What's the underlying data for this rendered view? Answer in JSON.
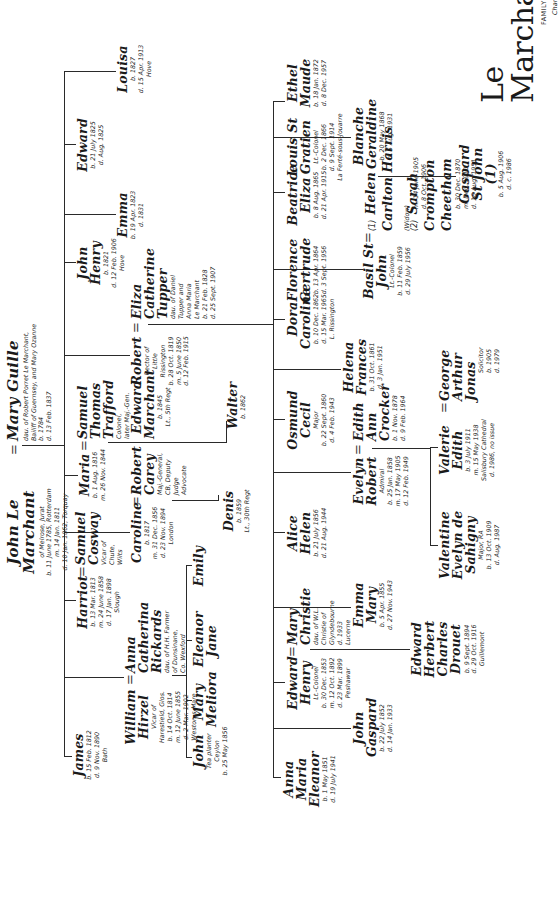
{
  "chart_title": {
    "title": "Le Marchant",
    "subtitle": "FAMILY TREE",
    "chart_no": "Chart I"
  },
  "root": {
    "husband": {
      "name": "John Le Marchant",
      "details": [
        "of Melrose, Jurat",
        "b. 11 June 1785, Rotterdam",
        "m. 14 Jan. 1811",
        "d. 10 Jan. 1862, Torquay"
      ]
    },
    "wife": {
      "name": "Mary Guille",
      "details": [
        "dau. of Robert Porret Le Marchant,",
        "Bailiff of Guernsey, and Mary Ozanne",
        "b. 1784",
        "d. 13 Feb. 1837"
      ]
    }
  },
  "gen2": [
    {
      "id": "james",
      "name": "James",
      "details": [
        "b. 15 Feb. 1812",
        "d. 9 Nov. 1890",
        "Bath"
      ]
    },
    {
      "id": "william",
      "name": "William Hirzel",
      "details": [
        "Vicar of",
        "Harestield, Glos.",
        "b. 14 Oct. 1814",
        "m. 12 June 1855",
        "d. 2 Mar. 1902",
        "Weston-s-Mare"
      ],
      "spouse": {
        "name": "Anna Catherina Rickards",
        "details": [
          "dau. of H.H. Farmer",
          "of Dunsinane,",
          "Co. Wexford"
        ]
      }
    },
    {
      "id": "harriot",
      "name": "Harriot",
      "details": [
        "b. 13 Mar. 1813",
        "m. 24 June 1858",
        "d. 17 Jan. 1898",
        "Slough"
      ],
      "spouse": {
        "name": "Samuel Cosway",
        "details": [
          "Vicar of",
          "Chute,",
          "Wilts"
        ]
      }
    },
    {
      "id": "caroline",
      "name": "Caroline",
      "details": [
        "b. 1817",
        "m. 31 Dec. 1856",
        "d. 23 Nov. 1894",
        "London"
      ],
      "spouse": {
        "name": "Robert Carey",
        "details": [
          "Maj.-General,",
          "CB, Deputy",
          "Judge",
          "Advocate"
        ]
      }
    },
    {
      "id": "maria",
      "name": "Maria",
      "details": [
        "b. 1 Aug. 1816",
        "m. 26 Nov. 1844"
      ],
      "spouse": {
        "name": "Samuel Thomas Trafford",
        "details": [
          "Colonel,",
          "later Maj.-Gen."
        ]
      }
    },
    {
      "id": "robert",
      "name": "Robert",
      "details": [
        "Rector of",
        "Little",
        "Rissington",
        "b. 28 Oct. 1819",
        "m. 5 June 1850",
        "d. 12 Feb. 1915"
      ],
      "spouse": {
        "name": "Eliza Catherine Tupper",
        "details": [
          "dau. of Daniel",
          "Tupper and",
          "Anna Maria",
          "Le Marchant",
          "b. 21 Feb. 1828",
          "d. 25 Sept. 1907"
        ]
      }
    },
    {
      "id": "john_henry",
      "name": "John Henry",
      "details": [
        "b. 1821",
        "d. 12 Feb. 1906",
        "Hove"
      ]
    },
    {
      "id": "emma",
      "name": "Emma",
      "details": [
        "b. 19 Apr. 1823",
        "d. 1831"
      ]
    },
    {
      "id": "edward",
      "name": "Edward",
      "details": [
        "b. 21 July 1825",
        "d. Aug. 1825"
      ]
    },
    {
      "id": "louisa",
      "name": "Louisa",
      "details": [
        "b. 1827",
        "d. 15 Apr. 1913",
        "Hove"
      ]
    }
  ],
  "gen3_william": [
    {
      "name": "John",
      "details": [
        "Tea planter",
        "Ceylon",
        "b. 25 May 1856"
      ]
    },
    {
      "name": "Mary Meliora",
      "details": []
    },
    {
      "name": "Eleanor Jane",
      "details": []
    },
    {
      "name": "Emily",
      "details": []
    }
  ],
  "gen3_caroline": [
    {
      "name": "Denis",
      "details": [
        "b. 1859",
        "Lt., 30th Regt"
      ]
    }
  ],
  "gen3_maria": [
    {
      "name": "Edward Marchant",
      "details": [
        "b. 1845",
        "Lt., 5th Regt"
      ]
    },
    {
      "name": "Walter",
      "details": [
        "b. 1862"
      ]
    }
  ],
  "gen3_robert": [
    {
      "name": "Anna Maria Eleanor",
      "details": [
        "b. 1 May 1851",
        "d. 19 July 1941"
      ]
    },
    {
      "name": "John Gaspard",
      "details": [
        "b. 22 July 1852",
        "d. 14 Jan. 1933"
      ]
    },
    {
      "name": "Edward Henry",
      "details": [
        "Lt.-Colonel",
        "b. 30 Dec. 1853",
        "m. 12 Oct. 1892",
        "d. 23 Mar. 1899",
        "Peshawar"
      ],
      "spouse": {
        "name": "Mary Christie",
        "details": [
          "dau. of W.L.",
          "Christie of",
          "Glyndebourne",
          "d. 1933",
          "Lucerne"
        ]
      }
    },
    {
      "name": "Emma Mary",
      "details": [
        "b. 5 Apr. 1855",
        "d. 27 Nov. 1943"
      ]
    },
    {
      "name": "Alice Helen",
      "details": [
        "b. 21 July 1856",
        "d. 21 Aug. 1944"
      ]
    },
    {
      "name": "Evelyn Robert",
      "details": [
        "Admiral",
        "b. 25 Jan. 1858",
        "m. 17 May 1905",
        "d. 12 Feb. 1949"
      ],
      "spouse": {
        "name": "Edith Ann Crocker",
        "details": [
          "b. 1 Nov. 1878",
          "d. 9 Feb. 1964"
        ]
      }
    },
    {
      "name": "Osmund Cecil",
      "details": [
        "Major",
        "b. 22 Sept. 1860",
        "d. 4 Feb. 1943"
      ]
    },
    {
      "name": "Helena Frances",
      "details": [
        "b. 31 Oct. 1861",
        "d. 3 Jan. 1951"
      ]
    },
    {
      "name": "Dora Caroline",
      "details": [
        "b. 10 Dec. 1862",
        "d. 15 Mar. 1965",
        "L. Rissington"
      ]
    },
    {
      "name": "Basil St John",
      "details": [
        "Lt.-Colonel",
        "b. 11 Feb. 1859",
        "d. 29 July 1956"
      ],
      "spouses": [
        {
          "label": "(1)",
          "name": "Helen Carlton Harris",
          "note": "(Widow)",
          "details": [
            "m. 14 June 1905",
            "d. 8 Oct. 1906"
          ]
        },
        {
          "label": "(2)",
          "name": "Sarah Crompton Cheetham",
          "details": [
            "b. 30 Dec. 1870",
            "m. Dec. 1910",
            "d. 16 Aug. 1951"
          ]
        }
      ]
    },
    {
      "name": "Florence Gertrude",
      "details": [
        "b. 13 Apr. 1864",
        "d. 3 Sept. 1956"
      ]
    },
    {
      "name": "Beatrice Eliza",
      "details": [
        "b. 8 Aug. 1865",
        "d. 21 Apr. 1915"
      ]
    },
    {
      "name": "Louis St Gratien",
      "details": [
        "Lt.-Colonel",
        "b. 2 Dec. 1866",
        "d. 9 Sept. 1914",
        "La Ferté-sous-Jouarre"
      ]
    },
    {
      "name": "Blanche Geraldine",
      "details": [
        "b. 20 May 1868",
        "d. 5 Aug. 1931"
      ]
    },
    {
      "name": "Ethel Maude",
      "details": [
        "b. 18 Jan. 1872",
        "d. 8 Dec. 1957"
      ]
    }
  ],
  "gen4": [
    {
      "parent": "Edward Henry",
      "name": "Edward Herbert Charles Drouet",
      "details": [
        "b. 9 Sept. 1894",
        "d. 29 Oct. 1916",
        "Guillemont"
      ]
    },
    {
      "parent": "Evelyn Robert",
      "name": "Valentine Evelyn de Sahigny",
      "details": [
        "Major, RA",
        "b. 13 Oct. 1909",
        "d. Aug. 1987"
      ]
    },
    {
      "parent": "Evelyn Robert",
      "name": "Valerie Edith",
      "details": [
        "b. 3 July 1911",
        "m. 15 May 1938",
        "Salisbury Cathedral",
        "d. 1986, no issue"
      ],
      "spouse": {
        "name": "George Arthur Jonas",
        "details": [
          "Solicitor",
          "b. 1905",
          "d. 1979"
        ]
      }
    },
    {
      "parent": "Basil St John",
      "name": "Gaspard St John (1)",
      "details": [
        "b. 5 Aug. 1906",
        "d. c. 1986"
      ]
    }
  ]
}
